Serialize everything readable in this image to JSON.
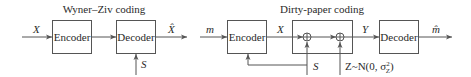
{
  "wyner_ziv": {
    "title": "Wyner–Ziv coding",
    "input": "X",
    "encoder": "Encoder",
    "decoder": "Decoder",
    "output": "X̂",
    "side_info": "S"
  },
  "dirty_paper": {
    "title": "Dirty-paper coding",
    "input": "m",
    "encoder": "Encoder",
    "channel_input": "X",
    "channel_output": "Y",
    "decoder": "Decoder",
    "output": "m̂",
    "state": "S",
    "noise": "Z~N(0, σ",
    "noise_sup": "2",
    "noise_sub": "Z",
    "noise_close": ")"
  },
  "colors": {
    "line": "#555555",
    "text": "#2a2a2a",
    "background": "#ffffff"
  }
}
